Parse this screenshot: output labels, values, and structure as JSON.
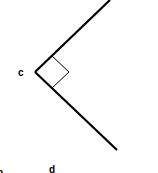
{
  "diagram": {
    "type": "right-angle",
    "vertex_label": "c",
    "bottom_label": "d",
    "bottom_left_partial_label": "b",
    "colors": {
      "line": "#000000",
      "background": "#ffffff"
    }
  }
}
